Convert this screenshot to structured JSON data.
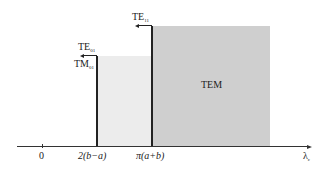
{
  "diagram": {
    "type": "mode-cutoff-wavelength-diagram",
    "regions": [
      {
        "name": "TE01/TM01 band",
        "x_from": "2(b-a)",
        "x_to": "π(a+b)",
        "shade": "#ececec"
      },
      {
        "name": "TEM band",
        "x_from": "π(a+b)",
        "x_to": "beyond",
        "shade": "#cfcfcf",
        "label": "TEM"
      }
    ],
    "labels": {
      "te11": {
        "main": "TE",
        "sub": "11"
      },
      "te01": {
        "main": "TE",
        "sub": "01"
      },
      "tm01": {
        "main": "TM",
        "sub": "01"
      },
      "tem": "TEM"
    },
    "axis": {
      "ticks": [
        "0",
        "2(b−a)",
        "π(a+b)"
      ],
      "xlabel_main": "λ",
      "xlabel_sub": "c"
    },
    "colors": {
      "light_region": "#ececec",
      "dark_region": "#cfcfcf",
      "line": "#222222"
    }
  }
}
